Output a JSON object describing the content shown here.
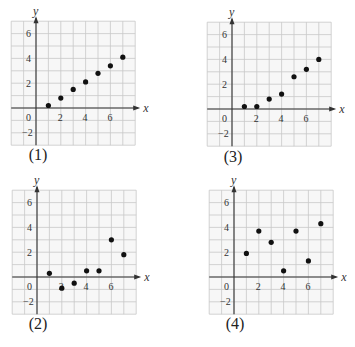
{
  "chart_data": [
    {
      "id": "1",
      "type": "scatter",
      "caption": "(1)",
      "xlabel": "x",
      "ylabel": "y",
      "xlim": [
        -2,
        8
      ],
      "ylim": [
        -3,
        7
      ],
      "xticks": [
        "0",
        "2",
        "4",
        "6"
      ],
      "yticks": [
        "6",
        "4",
        "2",
        "-2"
      ],
      "grid": true,
      "x": [
        1,
        2,
        3,
        4,
        5,
        6,
        7
      ],
      "y": [
        0.2,
        0.8,
        1.5,
        2.1,
        2.8,
        3.4,
        4.1
      ]
    },
    {
      "id": "3",
      "type": "scatter",
      "caption": "(3)",
      "xlabel": "x",
      "ylabel": "y",
      "xlim": [
        -2,
        8
      ],
      "ylim": [
        -3,
        7
      ],
      "xticks": [
        "0",
        "2",
        "4",
        "6"
      ],
      "yticks": [
        "6",
        "4",
        "2",
        "-2"
      ],
      "grid": true,
      "x": [
        1,
        2,
        3,
        4,
        5,
        6,
        7
      ],
      "y": [
        0.2,
        0.2,
        0.8,
        1.2,
        2.6,
        3.2,
        4.0
      ]
    },
    {
      "id": "2",
      "type": "scatter",
      "caption": "(2)",
      "xlabel": "x",
      "ylabel": "y",
      "xlim": [
        -2,
        8
      ],
      "ylim": [
        -3,
        7
      ],
      "xticks": [
        "0",
        "2",
        "4",
        "6"
      ],
      "yticks": [
        "6",
        "4",
        "2",
        "-2"
      ],
      "grid": true,
      "x": [
        1,
        2,
        3,
        4,
        5,
        6,
        7
      ],
      "y": [
        0.3,
        -0.9,
        -0.5,
        0.5,
        0.5,
        3.0,
        1.8
      ]
    },
    {
      "id": "4",
      "type": "scatter",
      "caption": "(4)",
      "xlabel": "x",
      "ylabel": "y",
      "xlim": [
        -2,
        8
      ],
      "ylim": [
        -3,
        7
      ],
      "xticks": [
        "0",
        "2",
        "4",
        "6"
      ],
      "yticks": [
        "6",
        "4",
        "2",
        "-2"
      ],
      "grid": true,
      "x": [
        1,
        2,
        3,
        4,
        5,
        6,
        7
      ],
      "y": [
        1.9,
        3.7,
        2.8,
        0.5,
        3.7,
        1.3,
        4.3
      ]
    }
  ],
  "layout": {
    "panels": [
      {
        "chart": 0,
        "left": 12,
        "top": 19,
        "axis_x": 36,
        "axis_y": 108,
        "caption_x": 38,
        "caption_y": 147
      },
      {
        "chart": 1,
        "left": 207,
        "top": 20,
        "axis_x": 232,
        "axis_y": 109,
        "caption_x": 233,
        "caption_y": 149
      },
      {
        "chart": 2,
        "left": 12,
        "top": 187,
        "axis_x": 37,
        "axis_y": 277,
        "caption_x": 38,
        "caption_y": 316
      },
      {
        "chart": 3,
        "left": 209,
        "top": 187,
        "axis_x": 234,
        "axis_y": 277,
        "caption_x": 235,
        "caption_y": 316
      }
    ],
    "unit_px": 12.4,
    "colors": {
      "grid": "#c8c8c8",
      "axis": "#333333",
      "dot": "#111111",
      "text": "#333333",
      "bg": "#ffffff"
    }
  }
}
